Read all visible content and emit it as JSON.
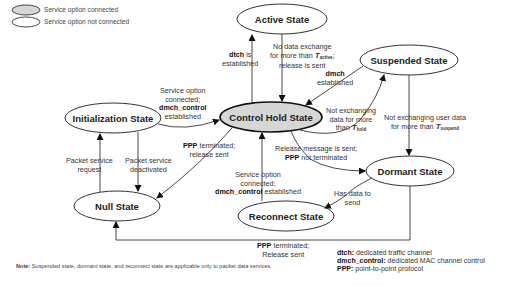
{
  "legend": {
    "connected": "Service option connected",
    "not_connected": "Service option not connected",
    "connected_fill": "#d6d6d6",
    "not_connected_fill": "#ffffff"
  },
  "states": {
    "active": "Active State",
    "suspended": "Suspended State",
    "initialization": "Initialization State",
    "control_hold": "Control Hold State",
    "dormant": "Dormant State",
    "null": "Null State",
    "reconnect": "Reconnect State"
  },
  "transitions": {
    "dtch_established": {
      "bold": "dtch",
      "l1": " is",
      "l2": "established"
    },
    "no_data_active": {
      "l1": "No data exchange",
      "l2": "for more than ",
      "T": "T",
      "sub": "active",
      "tail": ";",
      "l3": "release is sent"
    },
    "dmch_established": {
      "bold": "dmch",
      "l2": "established"
    },
    "svc_connected_init": {
      "l1": "Service option",
      "l2": "connected;",
      "bold": "dmch_control",
      "l4": "established"
    },
    "not_exch_hold": {
      "l1": "Not exchanging",
      "l2": "data for more",
      "l3": "than ",
      "T": "T",
      "sub": "hold"
    },
    "not_exch_suspend": {
      "l1": "Not exchanging user data",
      "l2": "for more than ",
      "T": "T",
      "sub": "suspend"
    },
    "packet_request": {
      "l1": "Packet service",
      "l2": "request"
    },
    "packet_deactivated": {
      "l1": "Packet service",
      "l2": "deactivated"
    },
    "ppp_terminated_ch": {
      "bold": "PPP",
      "l1": " terminated;",
      "l2": "release sent"
    },
    "release_msg_sent": {
      "l1": "Release message is sent;",
      "bold": "PPP",
      "l2": " not terminated"
    },
    "svc_connected_reconnect": {
      "l1": "Service option",
      "l2": "connected;",
      "bold": "dmch_control",
      "l3": " established"
    },
    "has_data": {
      "l1": "Has data to",
      "l2": "send"
    },
    "ppp_terminated_dormant": {
      "bold": "PPP",
      "l1": " terminated;",
      "l2": "Release sent"
    }
  },
  "abbreviations": [
    {
      "term": "dtch:",
      "desc": " dedicated traffic channel"
    },
    {
      "term": "dmch_control:",
      "desc": " dedicated MAC channel control"
    },
    {
      "term": "PPP:",
      "desc": " point-to-point protocol"
    }
  ],
  "note": {
    "label": "Note:",
    "text": " Suspended state, dormant state, and reconnect state are applicable only to packet data services."
  }
}
